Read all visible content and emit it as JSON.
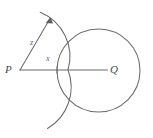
{
  "figure": {
    "type": "geometry-diagram",
    "background_color": "#ffffff",
    "stroke_color": "#6b6b6b",
    "label_color": "#4a4a4a",
    "points": [
      {
        "name": "P",
        "label": "P",
        "x": 20,
        "y": 70
      },
      {
        "name": "Q",
        "label": "Q",
        "x": 108,
        "y": 70
      }
    ],
    "segments": [
      {
        "name": "segment-PQ",
        "label": "x",
        "from": "P",
        "to": "Q",
        "x1": 20,
        "y1": 70,
        "x2": 108,
        "y2": 70,
        "tick_at_x": 57
      },
      {
        "name": "ray-z",
        "label": "z",
        "from": "P",
        "x1": 20,
        "y1": 70,
        "x2": 50,
        "y2": 19,
        "arrowhead": "end"
      }
    ],
    "arcs": [
      {
        "name": "arc-centred-at-P",
        "center": "P",
        "cx": 20,
        "cy": 70,
        "radius": 48,
        "start_x": 40,
        "start_y": 12,
        "end_x": 48,
        "end_y": 128
      }
    ],
    "circles": [
      {
        "name": "circle-centred-at-Q",
        "center": "Q",
        "cx": 98.5,
        "cy": 70.5,
        "radius": 41.5
      }
    ]
  },
  "labels": {
    "P": "P",
    "Q": "Q",
    "x": "x",
    "z": "z"
  }
}
